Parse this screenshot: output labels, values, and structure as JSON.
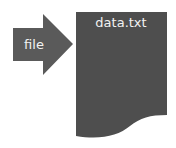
{
  "arrow": {
    "label": "file",
    "color": "#5a5a5a"
  },
  "document": {
    "label": "data.txt",
    "color": "#4e4e4e"
  }
}
